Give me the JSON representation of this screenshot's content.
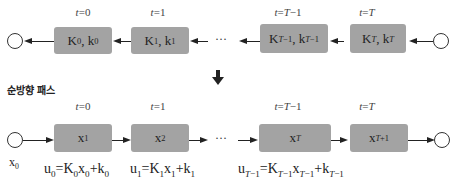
{
  "backward": {
    "time_labels": [
      "t=0",
      "t=1",
      "t=T−1",
      "t=T"
    ],
    "boxes": [
      "K₀, k₀",
      "K₁, k₁",
      "K_{T−1}, k_{T−1}",
      "K_T, k_T"
    ],
    "ellipsis": "···"
  },
  "section_title": "순방향 패스",
  "forward": {
    "time_labels": [
      "t=0",
      "t=1",
      "t=T−1",
      "t=T"
    ],
    "boxes": [
      "x₁",
      "x₂",
      "x_T",
      "x_{T+1}"
    ],
    "start_label": "x₀",
    "ellipsis": "···",
    "equations": [
      "u₀=K₀x₀+k₀",
      "u₁=K₁x₁+k₁",
      "u_{T−1}=K_{T−1}x_{T−1}+k_{T−1}"
    ]
  },
  "colors": {
    "box_fill": "#a3a3a3",
    "line": "#222222"
  }
}
